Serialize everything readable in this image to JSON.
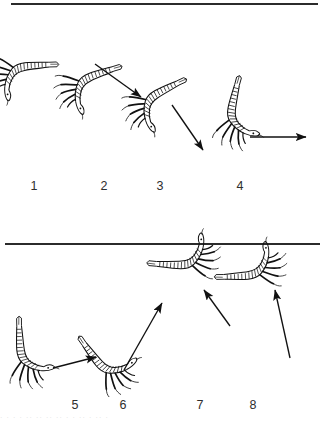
{
  "figure": {
    "type": "scientific-line-drawing-sequence",
    "background_color": "#ffffff",
    "ink_color": "#1a1a1a",
    "divider_color": "#2b2b2b",
    "label_color": "#2e2e2e",
    "rows": [
      {
        "name": "upper-row",
        "divider": {
          "name": "divider-top",
          "x": 11,
          "y": 3,
          "width": 307
        },
        "panels": [
          "1",
          "2",
          "3",
          "4"
        ]
      },
      {
        "name": "lower-row",
        "divider": {
          "name": "divider-mid",
          "x": 5,
          "y": 243,
          "width": 315
        },
        "panels": [
          "5",
          "6",
          "7",
          "8"
        ]
      }
    ]
  },
  "panels": [
    {
      "id": "panel-1",
      "label": "1",
      "label_x": 34,
      "label_y": 180,
      "body_angle_deg": 95,
      "description": "body hanging vertically downward from the surface line, tail up, legs splayed",
      "has_arrow": false,
      "arrow": null
    },
    {
      "id": "panel-2",
      "label": "2",
      "label_x": 104,
      "label_y": 180,
      "body_angle_deg": 78,
      "description": "body tilted, beginning downward-right movement",
      "has_arrow": true,
      "arrow": {
        "direction": "down-right",
        "angle_deg": 28,
        "x1": 93,
        "y1": 62,
        "x2": 142,
        "y2": 98
      }
    },
    {
      "id": "panel-3",
      "label": "3",
      "label_x": 160,
      "label_y": 180,
      "body_angle_deg": 70,
      "description": "body tilted further, continuing downward-right movement",
      "has_arrow": true,
      "arrow": {
        "direction": "down-right",
        "angle_deg": 52,
        "x1": 172,
        "y1": 104,
        "x2": 205,
        "y2": 152
      }
    },
    {
      "id": "panel-4",
      "label": "4",
      "label_x": 240,
      "label_y": 180,
      "body_angle_deg": 10,
      "description": "body nearly horizontal, moving straight to the right",
      "has_arrow": true,
      "arrow": {
        "direction": "right",
        "angle_deg": 0,
        "x1": 249,
        "y1": 137,
        "x2": 308,
        "y2": 137
      }
    },
    {
      "id": "panel-5",
      "label": "5",
      "label_x": 75,
      "label_y": 399,
      "body_angle_deg": 5,
      "description": "body horizontal and curved, slow rightward glide",
      "has_arrow": true,
      "arrow": {
        "direction": "up-right",
        "angle_deg": -13,
        "x1": 52,
        "y1": 368,
        "x2": 97,
        "y2": 357
      }
    },
    {
      "id": "panel-6",
      "label": "6",
      "label_x": 123,
      "label_y": 399,
      "body_angle_deg": -30,
      "description": "body angled upward-right, ascending",
      "has_arrow": true,
      "arrow": {
        "direction": "up-right",
        "angle_deg": -52,
        "x1": 123,
        "y1": 370,
        "x2": 163,
        "y2": 302
      }
    },
    {
      "id": "panel-7",
      "label": "7",
      "label_x": 200,
      "label_y": 399,
      "body_angle_deg": -80,
      "description": "body near vertical, ascending up and to the left",
      "has_arrow": true,
      "arrow": {
        "direction": "up-left",
        "angle_deg": -125,
        "x1": 229,
        "y1": 325,
        "x2": 203,
        "y2": 288
      }
    },
    {
      "id": "panel-8",
      "label": "8",
      "label_x": 253,
      "label_y": 399,
      "body_angle_deg": -85,
      "description": "body vertical, ascending steeply upward",
      "has_arrow": true,
      "arrow": {
        "direction": "up-left",
        "angle_deg": -105,
        "x1": 289,
        "y1": 357,
        "x2": 274,
        "y2": 288
      }
    }
  ],
  "caption_strip": {
    "text": "· · ·  · ·· ··  ·· ·· ·  ·  ··  ·  ·· ·",
    "note": "cropped line of text at the bottom edge, illegible"
  }
}
